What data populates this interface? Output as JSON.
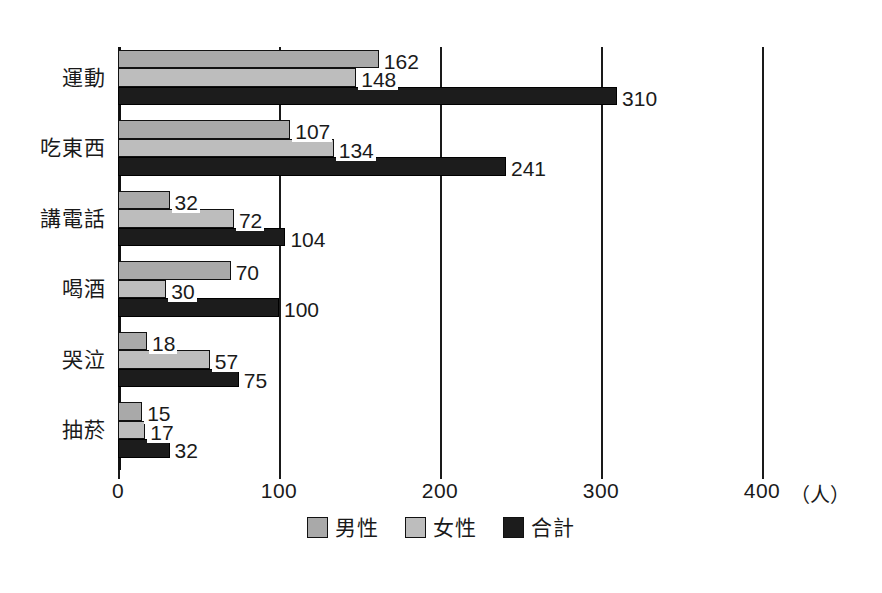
{
  "chart_data": {
    "type": "bar",
    "orientation": "horizontal",
    "title": "",
    "xlabel": "",
    "ylabel": "",
    "unit_label": "（人）",
    "xlim": [
      0,
      400
    ],
    "xticks": [
      0,
      100,
      200,
      300,
      400
    ],
    "xticklabels": [
      "0",
      "100",
      "200",
      "300",
      "400"
    ],
    "grid": true,
    "legend_position": "bottom-center",
    "categories": [
      "運動",
      "吃東西",
      "講電話",
      "喝酒",
      "哭泣",
      "抽菸"
    ],
    "series": [
      {
        "name": "男性",
        "color": "#a9a9a9",
        "values": [
          162,
          107,
          32,
          70,
          18,
          15
        ]
      },
      {
        "name": "女性",
        "color": "#bdbdbd",
        "values": [
          148,
          134,
          72,
          30,
          57,
          17
        ]
      },
      {
        "name": "合計",
        "color": "#1c1c1c",
        "values": [
          310,
          241,
          104,
          100,
          75,
          32
        ]
      }
    ]
  },
  "colors": {
    "male": "#a9a9a9",
    "female": "#bdbdbd",
    "total": "#1c1c1c",
    "axis": "#1a1a1a",
    "background": "#ffffff"
  }
}
